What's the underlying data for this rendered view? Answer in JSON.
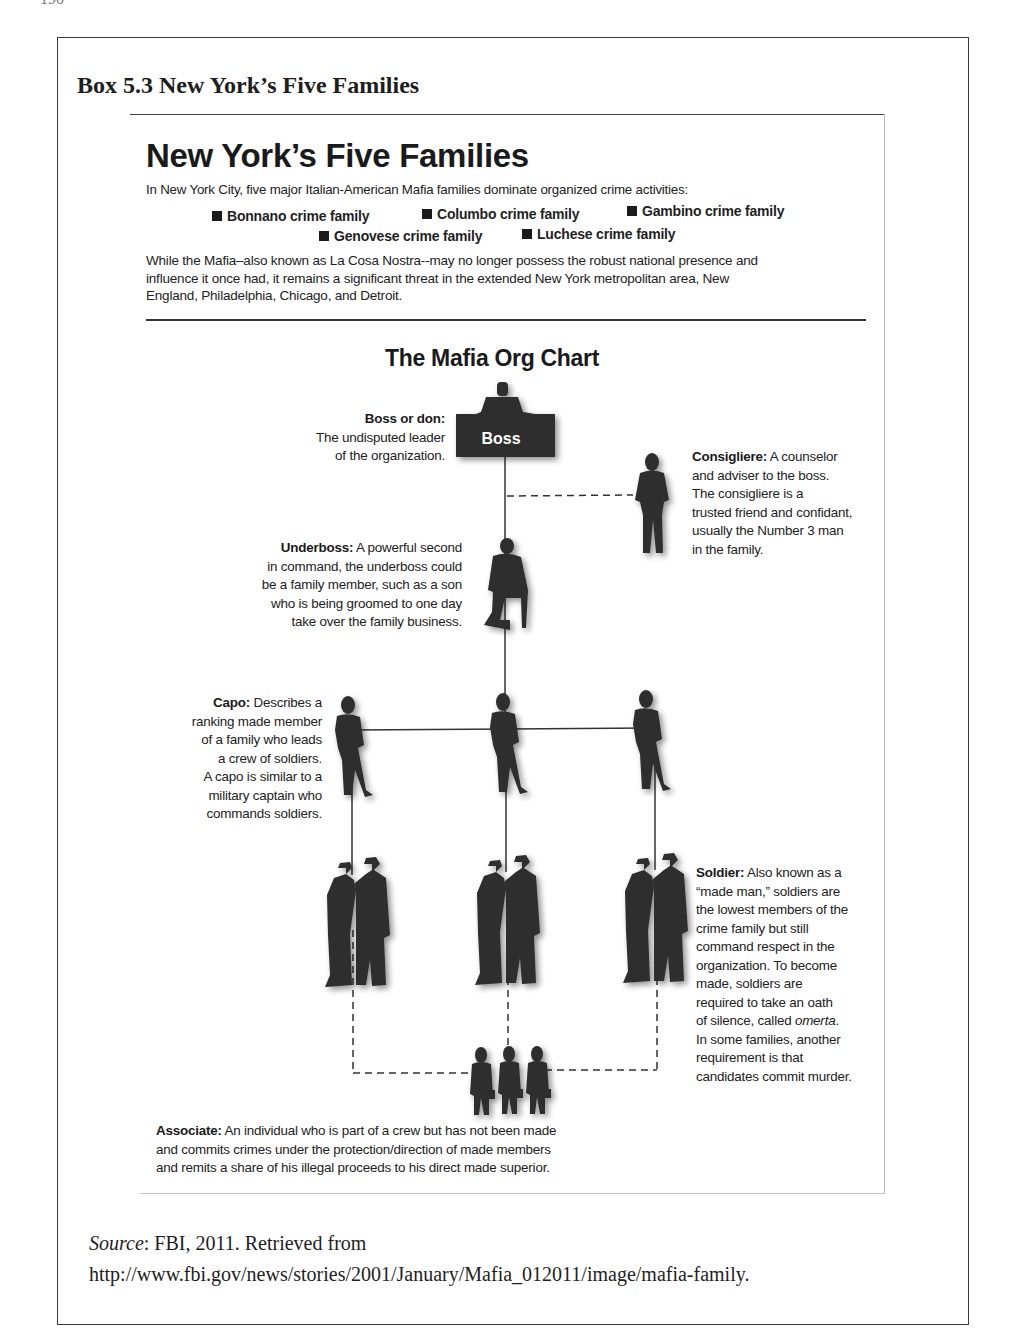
{
  "page": {
    "page_number": "190"
  },
  "box": {
    "title": "Box 5.3  New York’s Five Families"
  },
  "figure": {
    "title": "New York’s Five Families",
    "intro": "In New York City, five major Italian-American Mafia families dominate organized crime activities:",
    "families": [
      "Bonnano crime family",
      "Columbo crime family",
      "Gambino crime family",
      "Genovese crime family",
      "Luchese crime family"
    ],
    "paragraph_lines": [
      "While the Mafia–also known as La Cosa Nostra--may no longer possess the robust national presence and",
      "influence it once had, it remains a significant threat in the extended New York metropolitan area, New",
      "England, Philadelphia, Chicago, and Detroit."
    ],
    "org_chart": {
      "title": "The Mafia Org Chart",
      "boss_box_label": "Boss",
      "roles": {
        "boss": {
          "term": "Boss or don:",
          "lines": [
            "The undisputed leader",
            "of the organization."
          ]
        },
        "consigliere": {
          "term": "Consigliere:",
          "first_line_rest": " A counselor",
          "lines": [
            "and adviser to the boss.",
            "The consigliere is a",
            "trusted friend and confidant,",
            "usually the Number 3 man",
            "in the family."
          ]
        },
        "underboss": {
          "term": "Underboss:",
          "first_line_rest": " A powerful second",
          "lines": [
            "in command, the underboss could",
            "be a family member, such as a son",
            "who is being groomed to one day",
            "take over the family business."
          ]
        },
        "capo": {
          "term": "Capo:",
          "first_line_rest": " Describes a",
          "lines": [
            "ranking made member",
            "of a family who leads",
            "a crew of soldiers.",
            "A capo is similar to a",
            "military captain who",
            "commands soldiers."
          ]
        },
        "soldier": {
          "term": "Soldier:",
          "first_line_rest": " Also known as a",
          "lines": [
            "“made man,” soldiers are",
            "the lowest members of the",
            "crime family but still",
            "command respect in the",
            "organization. To become",
            "made, soldiers are",
            "required to take an oath"
          ],
          "omerta_prefix": "of silence, called ",
          "omerta_word": "omerta",
          "omerta_suffix": ".",
          "lines_after": [
            "In some families, another",
            "requirement is that",
            "candidates commit murder."
          ]
        },
        "associate": {
          "term": "Associate:",
          "first_line_rest": " An individual who is part of a crew but has not been made",
          "lines": [
            "and commits crimes under the protection/direction of made members",
            "and remits a share of his illegal proceeds to his direct made superior."
          ]
        }
      }
    }
  },
  "source": {
    "label": "Source",
    "line1_rest": ": FBI, 2011. Retrieved from",
    "line2": "http://www.fbi.gov/news/stories/2001/January/Mafia_012011/image/mafia-family."
  },
  "colors": {
    "silhouette": "#2f2f2f",
    "text": "#222222",
    "frame": "#3a3a3a"
  }
}
